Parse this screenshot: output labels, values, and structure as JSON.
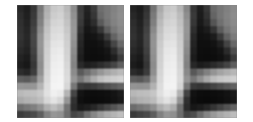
{
  "figure": {
    "title": "",
    "background_color": "#ffffff",
    "panel_count": 2,
    "layout": "side-by-side",
    "gap_px": 6
  },
  "panels": [
    {
      "name": "left-patch",
      "label": "",
      "width_px": 107,
      "height_px": 113,
      "grid_cols": 16,
      "grid_rows": 16,
      "interpolation": "bilinear",
      "colormap": "grayscale",
      "value_range": [
        0,
        255
      ]
    },
    {
      "name": "right-patch",
      "label": "",
      "width_px": 107,
      "height_px": 113,
      "grid_cols": 16,
      "grid_rows": 16,
      "interpolation": "bilinear",
      "colormap": "grayscale",
      "value_range": [
        0,
        255
      ]
    }
  ],
  "chart_data": {
    "type": "heatmap",
    "title": "",
    "subtitle": "",
    "xlabel": "",
    "ylabel": "",
    "colormap": "gray",
    "vmin": 0,
    "vmax": 255,
    "grid": false,
    "legend": "none",
    "xticklabels": [],
    "yticklabels": [],
    "panels": [
      {
        "name": "left-patch",
        "rows": 16,
        "cols": 16,
        "values": [
          [
            40,
            30,
            55,
            120,
            175,
            200,
            205,
            185,
            140,
            60,
            35,
            60,
            110,
            120,
            130,
            140
          ],
          [
            45,
            32,
            58,
            125,
            180,
            205,
            210,
            190,
            145,
            62,
            32,
            55,
            105,
            120,
            132,
            142
          ],
          [
            48,
            35,
            62,
            130,
            188,
            212,
            215,
            195,
            150,
            58,
            28,
            45,
            90,
            115,
            130,
            140
          ],
          [
            50,
            38,
            68,
            140,
            195,
            218,
            220,
            200,
            152,
            50,
            22,
            30,
            55,
            95,
            120,
            135
          ],
          [
            52,
            40,
            72,
            148,
            200,
            222,
            225,
            205,
            150,
            42,
            18,
            20,
            30,
            60,
            100,
            125
          ],
          [
            48,
            38,
            70,
            150,
            205,
            228,
            230,
            208,
            145,
            38,
            16,
            16,
            20,
            35,
            70,
            105
          ],
          [
            42,
            34,
            66,
            148,
            208,
            232,
            235,
            210,
            140,
            34,
            15,
            14,
            16,
            22,
            45,
            80
          ],
          [
            35,
            28,
            60,
            145,
            210,
            235,
            238,
            212,
            135,
            30,
            14,
            13,
            14,
            18,
            30,
            60
          ],
          [
            30,
            24,
            55,
            142,
            212,
            238,
            240,
            215,
            132,
            42,
            30,
            35,
            45,
            55,
            70,
            95
          ],
          [
            45,
            38,
            62,
            145,
            215,
            240,
            242,
            218,
            140,
            90,
            110,
            130,
            150,
            165,
            175,
            185
          ],
          [
            95,
            90,
            105,
            160,
            218,
            242,
            244,
            220,
            150,
            120,
            145,
            170,
            190,
            200,
            205,
            210
          ],
          [
            150,
            148,
            150,
            180,
            222,
            244,
            245,
            215,
            120,
            60,
            55,
            60,
            70,
            80,
            90,
            100
          ],
          [
            185,
            190,
            192,
            200,
            225,
            240,
            235,
            180,
            70,
            20,
            14,
            13,
            14,
            16,
            20,
            28
          ],
          [
            170,
            178,
            182,
            190,
            215,
            228,
            215,
            150,
            50,
            16,
            12,
            11,
            12,
            14,
            18,
            24
          ],
          [
            110,
            120,
            128,
            145,
            175,
            190,
            175,
            115,
            45,
            25,
            30,
            40,
            55,
            70,
            85,
            100
          ],
          [
            60,
            68,
            75,
            95,
            130,
            150,
            145,
            110,
            70,
            80,
            110,
            135,
            155,
            170,
            180,
            190
          ]
        ]
      },
      {
        "name": "right-patch",
        "rows": 16,
        "cols": 16,
        "values": [
          [
            35,
            28,
            50,
            115,
            170,
            198,
            202,
            180,
            135,
            55,
            30,
            55,
            105,
            118,
            128,
            138
          ],
          [
            40,
            30,
            55,
            122,
            178,
            203,
            208,
            188,
            142,
            58,
            28,
            50,
            100,
            118,
            130,
            140
          ],
          [
            45,
            33,
            60,
            128,
            186,
            210,
            213,
            193,
            148,
            55,
            25,
            42,
            85,
            112,
            128,
            138
          ],
          [
            48,
            36,
            66,
            138,
            193,
            216,
            218,
            198,
            150,
            47,
            20,
            28,
            52,
            92,
            118,
            133
          ],
          [
            50,
            38,
            70,
            146,
            198,
            220,
            223,
            203,
            148,
            40,
            17,
            19,
            28,
            58,
            98,
            123
          ],
          [
            46,
            36,
            68,
            148,
            203,
            226,
            228,
            206,
            143,
            36,
            15,
            15,
            19,
            33,
            68,
            103
          ],
          [
            40,
            32,
            64,
            146,
            206,
            230,
            233,
            208,
            138,
            32,
            14,
            13,
            15,
            21,
            43,
            78
          ],
          [
            33,
            26,
            58,
            143,
            208,
            233,
            236,
            210,
            133,
            28,
            13,
            12,
            13,
            17,
            28,
            58
          ],
          [
            28,
            22,
            53,
            140,
            210,
            236,
            238,
            213,
            130,
            40,
            28,
            33,
            43,
            53,
            68,
            93
          ],
          [
            43,
            36,
            60,
            143,
            213,
            238,
            240,
            216,
            138,
            88,
            108,
            128,
            148,
            163,
            173,
            183
          ],
          [
            93,
            88,
            103,
            158,
            216,
            240,
            242,
            218,
            148,
            118,
            143,
            168,
            188,
            198,
            203,
            208
          ],
          [
            148,
            146,
            148,
            178,
            220,
            242,
            243,
            213,
            118,
            58,
            53,
            58,
            68,
            78,
            88,
            98
          ],
          [
            183,
            188,
            190,
            198,
            223,
            238,
            233,
            178,
            68,
            18,
            13,
            12,
            13,
            15,
            19,
            26
          ],
          [
            168,
            176,
            180,
            188,
            213,
            226,
            213,
            148,
            48,
            15,
            11,
            10,
            11,
            13,
            17,
            23
          ],
          [
            108,
            118,
            126,
            143,
            173,
            188,
            173,
            113,
            43,
            23,
            28,
            38,
            53,
            68,
            83,
            98
          ],
          [
            58,
            66,
            73,
            93,
            128,
            148,
            143,
            108,
            68,
            78,
            108,
            133,
            153,
            168,
            178,
            188
          ]
        ]
      }
    ]
  }
}
